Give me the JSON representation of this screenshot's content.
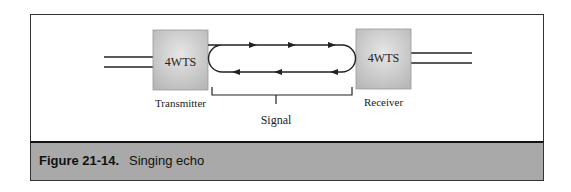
{
  "diagram": {
    "nodes": [
      {
        "id": "transmitter",
        "box_text": "4WTS",
        "label": "Transmitter"
      },
      {
        "id": "receiver",
        "box_text": "4WTS",
        "label": "Receiver"
      }
    ],
    "signal_label": "Signal",
    "loop": {
      "top_arrows_direction": "right",
      "bottom_arrows_direction": "left",
      "arrows_per_side": 3
    },
    "colors": {
      "box_fill": "#c8c8c8",
      "line": "#222222",
      "caption_bar": "#a9a9a9"
    }
  },
  "caption": {
    "number": "Figure 21-14.",
    "text": "Singing echo"
  }
}
